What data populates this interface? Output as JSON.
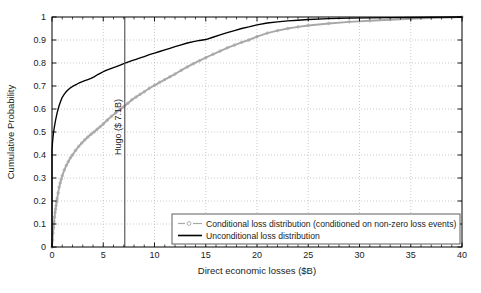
{
  "chart_data": {
    "type": "line",
    "title": "",
    "xlabel": "Direct economic losses ($B)",
    "ylabel": "Cumulative Probability",
    "xlim": [
      0,
      40
    ],
    "ylim": [
      0,
      1
    ],
    "xticks": [
      0,
      5,
      10,
      15,
      20,
      25,
      30,
      35,
      40
    ],
    "xticklabels": [
      "0",
      "5",
      "10",
      "15",
      "20",
      "25",
      "30",
      "35",
      "40"
    ],
    "yticks": [
      0,
      0.1,
      0.2,
      0.3,
      0.4,
      0.5,
      0.6,
      0.7,
      0.8,
      0.9,
      1
    ],
    "yticklabels": [
      "0",
      "0.1",
      "0.2",
      "0.3",
      "0.4",
      "0.5",
      "0.6",
      "0.7",
      "0.8",
      "0.9",
      "1"
    ],
    "xminor_step": 1,
    "grid": true,
    "grid_style": "dotted",
    "grid_color": "#b4b4b4",
    "legend_position": "lower right",
    "annotations": [
      {
        "name": "hugo-reference-line",
        "label": "Hugo ($ 7.1B)",
        "x": 7.1,
        "orientation": "vertical",
        "color": "#4d4d4d",
        "label_rotation": -90
      }
    ],
    "series": [
      {
        "name": "Conditional loss distribution (conditioned on non-zero loss events)",
        "key": "conditional",
        "color": "#a8a8a8",
        "marker": "circle",
        "linestyle": "solid",
        "x": [
          0.0,
          0.05,
          0.1,
          0.15,
          0.2,
          0.25,
          0.3,
          0.35,
          0.4,
          0.45,
          0.5,
          0.6,
          0.7,
          0.8,
          0.9,
          1.0,
          1.2,
          1.4,
          1.6,
          1.8,
          2.0,
          2.3,
          2.6,
          2.9,
          3.2,
          3.5,
          3.8,
          4.1,
          4.4,
          4.7,
          5.0,
          5.4,
          5.8,
          6.2,
          6.6,
          7.0,
          7.4,
          7.8,
          8.2,
          8.6,
          9.0,
          9.5,
          10.0,
          10.5,
          11.0,
          11.5,
          12.0,
          12.6,
          13.2,
          13.8,
          14.4,
          15.0,
          15.7,
          16.4,
          17.1,
          17.8,
          18.5,
          19.2,
          20.0,
          21.0,
          22.0,
          23.0,
          24.0,
          25.0,
          27.0,
          29.0,
          31.0,
          33.0,
          35.0,
          37.0,
          40.0
        ],
        "y": [
          0.0,
          0.03,
          0.06,
          0.085,
          0.11,
          0.13,
          0.15,
          0.165,
          0.18,
          0.195,
          0.21,
          0.235,
          0.26,
          0.278,
          0.295,
          0.31,
          0.335,
          0.355,
          0.372,
          0.388,
          0.4,
          0.42,
          0.437,
          0.452,
          0.466,
          0.478,
          0.49,
          0.5,
          0.512,
          0.523,
          0.535,
          0.552,
          0.568,
          0.583,
          0.597,
          0.61,
          0.625,
          0.64,
          0.652,
          0.664,
          0.675,
          0.69,
          0.703,
          0.716,
          0.728,
          0.74,
          0.752,
          0.768,
          0.783,
          0.797,
          0.81,
          0.823,
          0.838,
          0.852,
          0.866,
          0.878,
          0.89,
          0.9,
          0.915,
          0.93,
          0.941,
          0.95,
          0.957,
          0.963,
          0.972,
          0.979,
          0.984,
          0.988,
          0.992,
          0.995,
          1.0
        ]
      },
      {
        "name": "Unconditional loss distribution",
        "key": "unconditional",
        "color": "#000000",
        "marker": "none",
        "linestyle": "solid",
        "x": [
          0.0,
          0.0,
          0.05,
          0.1,
          0.15,
          0.2,
          0.25,
          0.3,
          0.35,
          0.4,
          0.5,
          0.6,
          0.7,
          0.8,
          0.9,
          1.0,
          1.2,
          1.4,
          1.6,
          1.8,
          2.0,
          2.3,
          2.6,
          2.9,
          3.2,
          3.5,
          3.8,
          4.1,
          4.4,
          4.7,
          5.0,
          5.4,
          5.8,
          6.2,
          6.6,
          7.0,
          7.4,
          7.8,
          8.2,
          8.6,
          9.0,
          9.5,
          10.0,
          10.5,
          11.0,
          11.5,
          12.0,
          12.6,
          13.2,
          13.8,
          14.4,
          15.0,
          15.7,
          16.4,
          17.1,
          17.8,
          18.5,
          19.2,
          20.0,
          21.0,
          22.0,
          23.0,
          24.0,
          25.0,
          27.0,
          29.0,
          31.0,
          33.0,
          35.0,
          37.0,
          40.0
        ],
        "y": [
          0.0,
          0.42,
          0.455,
          0.478,
          0.497,
          0.513,
          0.527,
          0.54,
          0.552,
          0.563,
          0.583,
          0.6,
          0.615,
          0.628,
          0.64,
          0.651,
          0.665,
          0.676,
          0.685,
          0.692,
          0.698,
          0.705,
          0.712,
          0.718,
          0.723,
          0.728,
          0.733,
          0.74,
          0.748,
          0.755,
          0.762,
          0.77,
          0.777,
          0.783,
          0.79,
          0.797,
          0.804,
          0.81,
          0.816,
          0.822,
          0.828,
          0.836,
          0.843,
          0.85,
          0.857,
          0.864,
          0.871,
          0.879,
          0.887,
          0.893,
          0.898,
          0.902,
          0.912,
          0.922,
          0.932,
          0.941,
          0.95,
          0.957,
          0.966,
          0.974,
          0.979,
          0.983,
          0.986,
          0.989,
          0.993,
          0.995,
          0.996,
          0.997,
          0.998,
          0.999,
          1.0
        ]
      }
    ]
  },
  "legend": {
    "entries": [
      {
        "label": "Conditional loss distribution (conditioned on non-zero loss events)"
      },
      {
        "label": "Unconditional loss distribution"
      }
    ]
  }
}
